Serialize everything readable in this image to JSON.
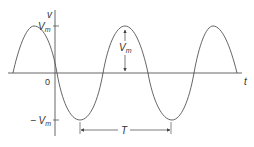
{
  "diagram": {
    "axes": {
      "y_label": "v",
      "x_label": "t",
      "origin_label": "0",
      "y_tick_pos": "V",
      "y_tick_pos_sub": "m",
      "y_tick_neg": "− V",
      "y_tick_neg_sub": "m"
    },
    "annotations": {
      "amplitude_label": "V",
      "amplitude_sub": "m",
      "period_label": "T"
    },
    "colors": {
      "line": "#555555",
      "text": "#333333"
    }
  }
}
